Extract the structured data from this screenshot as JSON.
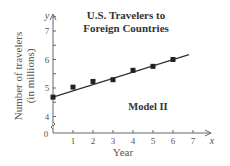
{
  "chart_data": {
    "type": "scatter",
    "title": "U.S. Travelers to Foreign Countries",
    "title_lines": [
      "U.S. Travelers to",
      "Foreign Countries"
    ],
    "annotation": "Model II",
    "xlabel": "Year",
    "ylabel": "Number of travelers (in millions)",
    "ylabel_lines": [
      "Number of travelers",
      "(in millions)"
    ],
    "x_var": "x",
    "y_var": "y",
    "x_ticks": [
      "1",
      "2",
      "3",
      "4",
      "5",
      "6",
      "7"
    ],
    "y_ticks": [
      "4",
      "5",
      "6",
      "7"
    ],
    "origin_label": "0",
    "xlim": [
      0,
      7
    ],
    "ylim": [
      3.6,
      7.5
    ],
    "y_axis_break": true,
    "grid": false,
    "series": [
      {
        "name": "Data points",
        "x": [
          0,
          1,
          2,
          3,
          4,
          5,
          6
        ],
        "values": [
          4.68,
          5.03,
          5.23,
          5.29,
          5.62,
          5.76,
          6.0
        ]
      }
    ],
    "fit_line": {
      "name": "Model II (linear fit)",
      "x_start": 0,
      "y_start": 4.68,
      "x_end": 6.8,
      "y_end": 6.17
    }
  }
}
